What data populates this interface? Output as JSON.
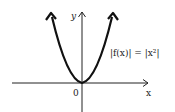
{
  "diagram": {
    "function_label": "|f(x)| = |x²|",
    "x_axis_label": "x",
    "y_axis_label": "y",
    "origin_label": "0",
    "curve": "parabola y = x^2",
    "stroke_color": "#111111"
  }
}
